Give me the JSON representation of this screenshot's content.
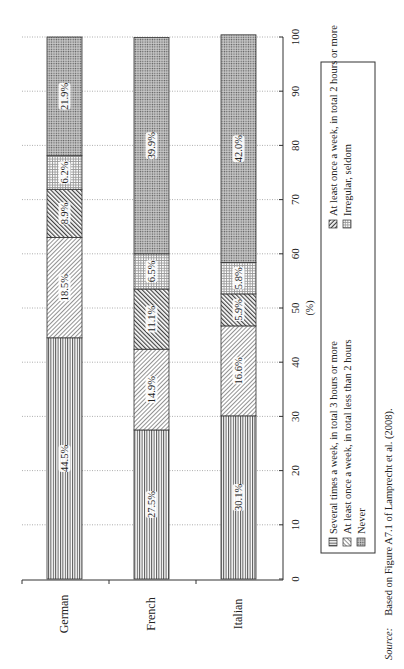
{
  "chart_data": {
    "type": "bar",
    "orientation": "horizontal-stacked-100 (page rotated 90deg)",
    "categories": [
      "German",
      "French",
      "Italian"
    ],
    "series": [
      {
        "name": "Several times a week, in total 3 hours or more",
        "pattern": "vertical-lines",
        "values": [
          44.5,
          27.5,
          30.1
        ]
      },
      {
        "name": "At least once a week, in total less than 2 hours",
        "pattern": "fine-diagonal",
        "values": [
          18.5,
          14.9,
          16.6
        ]
      },
      {
        "name": "At least once a week, in total 2 hours or more",
        "pattern": "bold-diagonal",
        "values": [
          8.9,
          11.1,
          5.9
        ]
      },
      {
        "name": "Irregular, seldom",
        "pattern": "grid",
        "values": [
          6.2,
          6.5,
          5.8
        ]
      },
      {
        "name": "Never",
        "pattern": "dots",
        "values": [
          21.9,
          39.9,
          42.0
        ]
      }
    ],
    "labels": [
      [
        "44.5%",
        "18.5%",
        "8.9%",
        "6.2%",
        "21.9%"
      ],
      [
        "27.5%",
        "14.9%",
        "11.1%",
        "6.5%",
        "39.9%"
      ],
      [
        "30.1%",
        "16.6%",
        "5.9%",
        "5.8%",
        "42.0%"
      ]
    ],
    "title": "",
    "xlabel": "(%)",
    "ylabel": "",
    "xlim": [
      0,
      100
    ],
    "ticks": [
      "0",
      "10",
      "20",
      "30",
      "40",
      "50",
      "60",
      "70",
      "80",
      "90",
      "100"
    ],
    "grid": "dotted at each tick",
    "legend_position": "bottom (rotated)"
  },
  "legend": {
    "items": [
      "Several times a week, in total 3 hours or more",
      "At least once a week, in total less than 2 hours",
      "Never",
      "At least once a week, in total 2 hours or more",
      "Irregular, seldom"
    ]
  },
  "source": {
    "label": "Source:",
    "text": "Based on Figure A7.1 of Lamprecht et al. (2008)."
  }
}
